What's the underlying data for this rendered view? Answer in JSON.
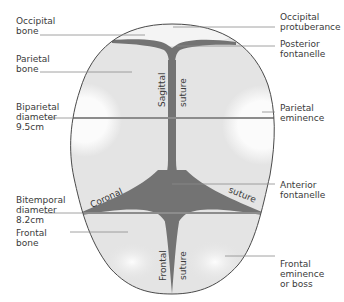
{
  "diagram": {
    "colors": {
      "bone_fill": "#e4e4e4",
      "eminence_highlight": "#fafafa",
      "suture_fill": "#737373",
      "outline": "#4a4a4a",
      "diameter_line": "#8c8c8c",
      "leader_line": "#8a8a8a",
      "text": "#3a3a3a"
    },
    "labels_left": [
      {
        "id": "occipital-bone",
        "text": "Occipital\nbone"
      },
      {
        "id": "parietal-bone",
        "text": "Parietal\nbone"
      },
      {
        "id": "biparietal-diameter",
        "text": "Biparietal\ndiameter\n9.5cm"
      },
      {
        "id": "bitemporal-diameter",
        "text": "Bitemporal\ndiameter\n8.2cm"
      },
      {
        "id": "frontal-bone",
        "text": "Frontal\nbone"
      }
    ],
    "labels_right": [
      {
        "id": "occipital-protuberance",
        "text": "Occipital\nprotuberance"
      },
      {
        "id": "posterior-fontanelle",
        "text": "Posterior\nfontanelle"
      },
      {
        "id": "parietal-eminence",
        "text": "Parietal\neminence"
      },
      {
        "id": "anterior-fontanelle",
        "text": "Anterior\nfontanelle"
      },
      {
        "id": "frontal-eminence",
        "text": "Frontal\neminence\nor boss"
      }
    ],
    "inline_labels": {
      "sagittal": "Sagittal",
      "sagittal_suture": "suture",
      "coronal": "Coronal",
      "coronal_suture": "suture",
      "frontal": "Frontal",
      "frontal_suture": "suture"
    },
    "measurements": {
      "biparietal_diameter_cm": 9.5,
      "bitemporal_diameter_cm": 8.2
    }
  }
}
